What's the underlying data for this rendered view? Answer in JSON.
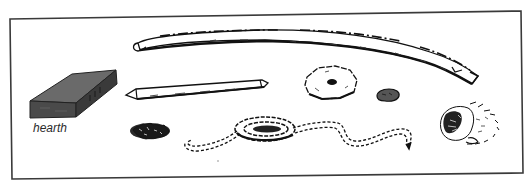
{
  "figure": {
    "labels": {
      "hearth": "hearth"
    },
    "items": [
      {
        "id": "bow",
        "name": "bow"
      },
      {
        "id": "hearth",
        "name": "hearth board"
      },
      {
        "id": "drill",
        "name": "drill / spindle"
      },
      {
        "id": "socket",
        "name": "socket stone"
      },
      {
        "id": "pebble",
        "name": "small stone"
      },
      {
        "id": "tinder-clump",
        "name": "tinder clump"
      },
      {
        "id": "cord",
        "name": "coiled cord"
      },
      {
        "id": "tinder-bundle",
        "name": "tinder bundle"
      }
    ],
    "colors": {
      "frame": "#3a3a3a",
      "ink": "#111111",
      "hearth_top": "#6a6a6a",
      "hearth_front": "#4a4a4a",
      "hearth_side": "#3a3a3a",
      "paper": "#ffffff"
    }
  }
}
